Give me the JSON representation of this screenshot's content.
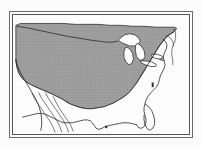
{
  "figure": {
    "kind": "map",
    "subject": "Contiguous United States",
    "projection_hint": "conic",
    "frame": {
      "style": "double-rule rectangle",
      "outer_border_color": "#6b6b6b",
      "inner_border_color": "#555555",
      "background_color": "#ffffff"
    },
    "render": {
      "page_background": "#fbfbfb",
      "shaded_fill_color": "#9d9d9d",
      "shaded_fill_color_alt": "#a4a4a4",
      "unshaded_fill_color": "#ffffff",
      "coastline_color": "#2b2b2b",
      "internal_line_color": "#3a3a3a",
      "lake_fill_color": "#ffffff",
      "line_width": 0.9
    },
    "legend_visible": false,
    "title_visible": false,
    "scale_bar_visible": false,
    "north_arrow_visible": false,
    "labels_visible": false
  },
  "map_data": {
    "type": "range-map",
    "viewbox": "0 0 184 127",
    "features": [
      {
        "name": "us-shaded-range",
        "role": "shaded-distribution-area",
        "fill": "#9d9d9d",
        "stroke": "#2b2b2b",
        "path": "M 4 10 L 4 14 L 4 22 L 4 36 L 4 52 L 5 60 L 7 66 L 10 70 L 14 73 L 19 75 L 26 78 L 33 81 L 40 84 L 46 87 L 51 90 L 56 93 L 61 96 L 66 98 L 72 100 L 78 101 L 84 101 L 90 100 L 96 99 L 101 97 L 106 95 L 111 92 L 116 89 L 120 86 L 124 82 L 127 78 L 130 74 L 133 69 L 136 64 L 139 59 L 142 54 L 145 49 L 148 44 L 151 39 L 154 34 L 157 30 L 160 26 L 163 23 L 166 21 L 169 19 L 171 17 L 172 15 L 171 14 L 167 14 L 160 14 L 150 14 L 138 13 L 126 13 L 114 12 L 102 11 L 90 11 L 78 10 L 66 10 L 54 9 L 42 9 L 30 9 L 18 9 L 10 9 Z"
      }
    ],
    "outlines": [
      {
        "name": "national-boundary-and-coastline",
        "role": "country-outline",
        "stroke": "#2b2b2b",
        "path": "M 4 12 L 10 12 L 20 13 L 32 14 L 46 16 L 58 18 L 70 20 L 80 22 L 88 23 L 94 24 L 98 25 L 101 26 L 104 27 L 107 28 L 110 28 L 113 28"
      },
      {
        "name": "great-lakes-superior",
        "role": "lake",
        "fill": "#ffffff",
        "stroke": "#2b2b2b",
        "path": "M 113 28 L 116 25 L 120 23 L 124 22 L 128 23 L 131 25 L 133 28 L 132 31 L 129 33 L 125 34 L 120 33 L 116 31 Z"
      },
      {
        "name": "great-lakes-michigan",
        "role": "lake",
        "fill": "#ffffff",
        "stroke": "#2b2b2b",
        "path": "M 120 34 L 123 36 L 125 40 L 126 45 L 125 49 L 122 51 L 119 50 L 117 46 L 117 41 L 118 36 Z"
      },
      {
        "name": "great-lakes-huron",
        "role": "lake",
        "fill": "#ffffff",
        "stroke": "#2b2b2b",
        "path": "M 131 31 L 134 33 L 136 37 L 137 42 L 136 46 L 133 47 L 130 44 L 129 39 L 129 34 Z"
      },
      {
        "name": "great-lakes-erie",
        "role": "lake",
        "fill": "#ffffff",
        "stroke": "#2b2b2b",
        "path": "M 134 48 L 139 48 L 144 49 L 148 51 L 148 53 L 144 53 L 139 52 L 135 50 Z"
      },
      {
        "name": "great-lakes-ontario",
        "role": "lake",
        "fill": "#ffffff",
        "stroke": "#2b2b2b",
        "path": "M 145 43 L 150 43 L 154 44 L 155 46 L 152 47 L 148 46 L 145 45 Z"
      },
      {
        "name": "atlantic-coast-northeast",
        "role": "coastline",
        "stroke": "#2b2b2b",
        "path": "M 160 24 L 163 27 L 164 31 L 163 35 L 161 39 L 160 43 L 161 47 L 162 51 L 161 55 L 159 59 L 157 63 L 156 67 L 155 71 L 153 75 L 150 78 L 147 81 L 144 84 L 141 88 L 139 92 L 138 96 L 138 100 L 139 104 L 140 108 L 139 112 L 137 115 L 134 117 L 131 117 L 129 115 L 128 112"
      },
      {
        "name": "gulf-coast",
        "role": "coastline",
        "stroke": "#2b2b2b",
        "path": "M 128 112 L 124 111 L 119 110 L 114 110 L 109 111 L 104 112 L 99 113 L 95 115 L 92 117 L 89 118 L 86 117 L 84 115 L 83 112 L 81 110 L 78 109 L 74 109 L 70 110 L 66 111 L 62 112 L 58 113 L 54 113 L 50 112 L 46 110 L 42 108 L 38 106 L 34 104 L 30 103 L 26 103 L 22 104 L 18 105 L 14 106 L 10 107"
      },
      {
        "name": "pacific-coast",
        "role": "coastline",
        "stroke": "#2b2b2b",
        "path": "M 4 52 L 6 58 L 9 64 L 13 70 L 17 76 L 21 82 L 25 88 L 28 94 L 30 100 L 31 106 L 31 112 L 30 118 L 28 121"
      },
      {
        "name": "baja-peninsula-west",
        "role": "coastline",
        "stroke": "#3a3a3a",
        "path": "M 22 84 L 25 90 L 29 96 L 33 102 L 37 108 L 41 114 L 44 120 L 46 124"
      },
      {
        "name": "baja-peninsula-east",
        "role": "coastline",
        "stroke": "#3a3a3a",
        "path": "M 29 83 L 32 89 L 36 95 L 40 101 L 44 107 L 48 113 L 51 119 L 53 124"
      },
      {
        "name": "gulf-of-california",
        "role": "coastline",
        "stroke": "#3a3a3a",
        "path": "M 36 82 L 39 88 L 43 94 L 47 100 L 51 106 L 55 112 L 58 118 L 60 123"
      },
      {
        "name": "mexico-interior-line",
        "role": "internal-boundary",
        "stroke": "#3a3a3a",
        "path": "M 44 86 L 47 92 L 50 98 L 54 104 L 58 110 L 62 116 L 65 122"
      },
      {
        "name": "florida-peninsula",
        "role": "coastline",
        "stroke": "#2b2b2b",
        "path": "M 138 96 L 142 99 L 145 103 L 147 107 L 148 112 L 148 117 L 146 121 L 143 123 L 140 122 L 138 118 L 137 113 L 137 108"
      },
      {
        "name": "northern-border-canada",
        "role": "internal-boundary",
        "stroke": "#2b2b2b",
        "path": "M 5 13 L 18 15 L 34 18 L 50 21 L 64 24 L 76 26 L 86 28 L 94 29 L 100 30 L 105 30 L 109 29"
      },
      {
        "name": "atlantic-offshore-margin",
        "role": "coastline",
        "stroke": "#3a3a3a",
        "path": "M 170 16 L 172 20 L 172 25 L 171 30 L 169 34 L 168 39 L 168 44 L 169 49 L 169 54"
      }
    ],
    "shaded_region_note": "grey distribution shading",
    "unshaded_region_note": "white coastal and peripheral areas"
  },
  "accessibility": {
    "alt_text": "Black and white map of the contiguous United States with most of the country shaded grey, Great Lakes shown in white, and unshaded white margins along the southwest, Gulf and southeast Atlantic coasts."
  }
}
